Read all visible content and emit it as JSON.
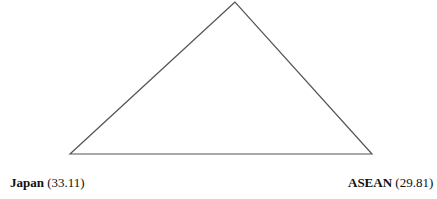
{
  "diagram": {
    "type": "triangle",
    "vertices": {
      "top": {
        "x": 235,
        "y": 2,
        "label": ""
      },
      "left": {
        "x": 70,
        "y": 154
      },
      "right": {
        "x": 372,
        "y": 154
      }
    },
    "line_color": "#555555"
  },
  "labels": {
    "left": {
      "name": "Japan",
      "value": "(33.11)"
    },
    "right": {
      "name": "ASEAN",
      "value": "(29.81)"
    }
  }
}
